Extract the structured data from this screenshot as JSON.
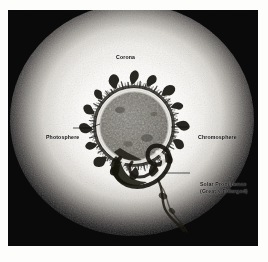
{
  "figure": {
    "medium": "halftone photographic illustration",
    "background_color": "#ffffff",
    "plate_color": "#080808",
    "corona_color": "#f4f3ef",
    "disc_color": "#6e6b66",
    "ink_color": "#0b0b0b"
  },
  "labels": {
    "corona": "Corona",
    "photosphere": "Photosphere",
    "chromosphere": "Chromosphere",
    "prominence_line1": "Solar Prominence",
    "prominence_line2": "(Greatly Enlarged)"
  },
  "diagram_parts": [
    {
      "name": "corona",
      "label": "Corona",
      "description": "broad diffuse white halo filling the plate, fading to black toward the corners",
      "has_leader_line": false
    },
    {
      "name": "photosphere",
      "label": "Photosphere",
      "description": "mottled grey solar disc, the visible surface",
      "has_leader_line": true,
      "leader_side": "left"
    },
    {
      "name": "chromosphere",
      "label": "Chromosphere",
      "description": "dark spicule fringe of flame-like jets ringing the disc",
      "has_leader_line": true,
      "leader_side": "right"
    },
    {
      "name": "solar-prominence",
      "label": "Solar Prominence (Greatly Enlarged)",
      "description": "large looping swirl of gas erupting from the lower right limb, with a trailing wisp",
      "has_leader_line": true,
      "leader_side": "right"
    }
  ],
  "geometry": {
    "plate": {
      "x": 8,
      "y": 10,
      "width": 250,
      "height": 236
    },
    "sun_disc": {
      "center_x": 134,
      "center_y": 126,
      "radius": 37
    },
    "corona_center": {
      "x": 132,
      "y": 118
    },
    "corona_radius_x": 118,
    "corona_radius_y": 112
  }
}
